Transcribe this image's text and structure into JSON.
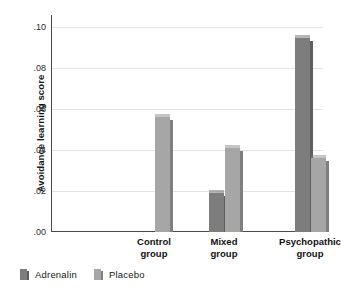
{
  "chart_data": {
    "type": "bar",
    "title": "",
    "subtitle": "",
    "xlabel": "",
    "ylabel": "Avoidance learning score",
    "categories": [
      "Control group",
      "Mixed group",
      "Psychopathic group"
    ],
    "category_lines": [
      [
        "Control",
        "group"
      ],
      [
        "Mixed",
        "group"
      ],
      [
        "Psychopathic",
        "group"
      ]
    ],
    "series": [
      {
        "name": "Adrenalin",
        "color": "#7d7d7d",
        "values": [
          null,
          0.019,
          0.095
        ]
      },
      {
        "name": "Placebo",
        "color": "#a6a6a6",
        "values": [
          0.056,
          0.041,
          0.036
        ]
      }
    ],
    "ylim": [
      0.0,
      0.106
    ],
    "yticks": [
      0.0,
      0.02,
      0.04,
      0.06,
      0.08,
      0.1
    ],
    "ytick_labels": [
      ".00",
      ".02",
      ".04",
      ".06",
      ".08",
      ".10"
    ],
    "grid": true,
    "grid_axis": "y",
    "legend_position": "bottom-left",
    "legend_entries": [
      "Adrenalin",
      "Placebo"
    ]
  },
  "colors": {
    "adrenalin": "#7d7d7d",
    "adrenalin_shade": "#5e5e5e",
    "placebo": "#a6a6a6",
    "placebo_shade": "#7f7f7f",
    "axis": "#4a4a4a",
    "grid": "#e3e3e3",
    "text": "#161616",
    "background": "#ffffff"
  }
}
